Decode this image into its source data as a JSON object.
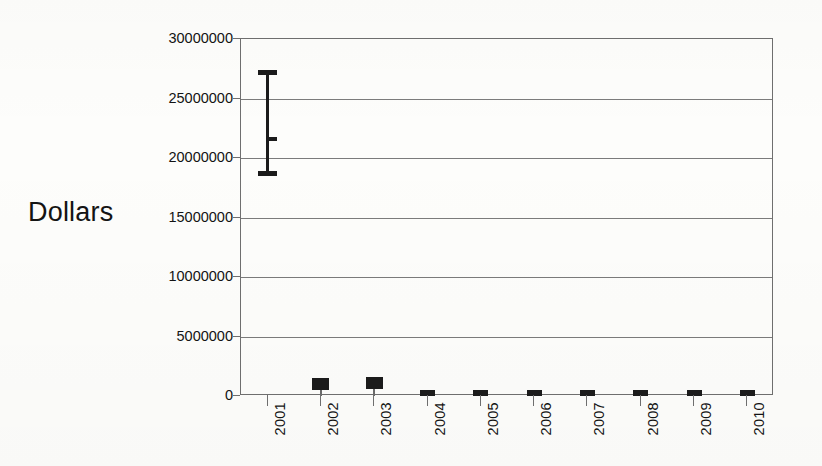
{
  "chart_data": {
    "type": "bar",
    "title": "",
    "subtitle": "",
    "xlabel": "",
    "ylabel": "Dollars",
    "categories": [
      "2001",
      "2002",
      "2003",
      "2004",
      "2005",
      "2006",
      "2007",
      "2008",
      "2009",
      "2010"
    ],
    "values": [
      21600000,
      1000000,
      1100000,
      300000,
      300000,
      300000,
      300000,
      300000,
      300000,
      300000
    ],
    "series": [
      {
        "name": "Dollars",
        "values": [
          21600000,
          1000000,
          1100000,
          300000,
          300000,
          300000,
          300000,
          300000,
          300000,
          300000
        ]
      }
    ],
    "error_bars": [
      {
        "category": "2001",
        "low": 18700000,
        "high": 27200000,
        "center": 21600000
      }
    ],
    "ylim": [
      0,
      30000000
    ],
    "ytick_labels": [
      "0",
      "5000000",
      "10000000",
      "15000000",
      "20000000",
      "25000000",
      "30000000"
    ],
    "ytick_values": [
      0,
      5000000,
      10000000,
      15000000,
      20000000,
      25000000,
      30000000
    ],
    "xtick_labels": [
      "2001",
      "2002",
      "2003",
      "2004",
      "2005",
      "2006",
      "2007",
      "2008",
      "2009",
      "2010"
    ],
    "grid": true,
    "grid_axis": "y",
    "legend": false,
    "legend_position": "none",
    "bar_color": "#1b1b1b",
    "axis_color": "#6f6f6f",
    "grid_color": "#7b7b7b",
    "background_color": "#fdfdfb",
    "annotations": []
  },
  "axis_title": {
    "y": "Dollars"
  }
}
